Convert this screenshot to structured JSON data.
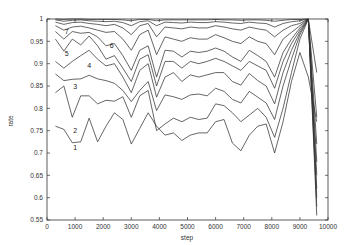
{
  "chart_data": {
    "type": "line",
    "title": "",
    "xlabel": "step",
    "ylabel": "rate",
    "xlim": [
      0,
      10000
    ],
    "ylim": [
      0.55,
      1.0
    ],
    "grid": false,
    "legend": "none (inline curve labels)",
    "x_ticks": [
      "0",
      "1000",
      "2000",
      "3000",
      "4000",
      "5000",
      "6000",
      "7000",
      "8000",
      "9000",
      "10000"
    ],
    "y_ticks": [
      "0.55",
      "0.6",
      "0.65",
      "0.7",
      "0.75",
      "0.8",
      "0.85",
      "0.9",
      "0.95",
      "1"
    ],
    "x": [
      300,
      600,
      900,
      1200,
      1500,
      1800,
      2100,
      2400,
      2700,
      3000,
      3300,
      3600,
      3900,
      4200,
      4500,
      4800,
      5100,
      5400,
      5700,
      6000,
      6300,
      6600,
      6900,
      7200,
      7500,
      7800,
      8100,
      8400,
      8700,
      9000,
      9300,
      9600
    ],
    "series": [
      {
        "name": "1",
        "label": "1",
        "values": [
          0.76,
          0.753,
          0.723,
          0.725,
          0.778,
          0.725,
          0.76,
          0.79,
          0.775,
          0.72,
          0.755,
          0.79,
          0.76,
          0.74,
          0.745,
          0.728,
          0.74,
          0.745,
          0.745,
          0.77,
          0.775,
          0.722,
          0.705,
          0.74,
          0.76,
          0.765,
          0.7,
          0.77,
          0.86,
          0.925,
          0.87,
          0.77
        ]
      },
      {
        "name": "2",
        "label": "2",
        "values": [
          0.835,
          0.85,
          0.78,
          0.828,
          0.828,
          0.81,
          0.818,
          0.816,
          0.826,
          0.78,
          0.828,
          0.84,
          0.75,
          0.765,
          0.778,
          0.77,
          0.78,
          0.775,
          0.778,
          0.81,
          0.806,
          0.79,
          0.77,
          0.785,
          0.8,
          0.78,
          0.735,
          0.8,
          0.88,
          0.955,
          1.0,
          0.56
        ]
      },
      {
        "name": "3",
        "label": "3",
        "values": [
          0.877,
          0.862,
          0.865,
          0.866,
          0.874,
          0.866,
          0.862,
          0.856,
          0.84,
          0.815,
          0.84,
          0.86,
          0.795,
          0.83,
          0.826,
          0.82,
          0.83,
          0.832,
          0.828,
          0.845,
          0.838,
          0.82,
          0.812,
          0.838,
          0.825,
          0.812,
          0.775,
          0.85,
          0.91,
          0.965,
          1.0,
          0.58
        ]
      },
      {
        "name": "4",
        "label": "4",
        "values": [
          0.905,
          0.89,
          0.905,
          0.918,
          0.93,
          0.91,
          0.895,
          0.9,
          0.87,
          0.835,
          0.885,
          0.9,
          0.825,
          0.87,
          0.88,
          0.86,
          0.875,
          0.87,
          0.875,
          0.88,
          0.88,
          0.86,
          0.852,
          0.878,
          0.862,
          0.85,
          0.81,
          0.88,
          0.93,
          0.97,
          1.0,
          0.6
        ]
      },
      {
        "name": "5",
        "label": "5",
        "values": [
          0.955,
          0.928,
          0.955,
          0.942,
          0.962,
          0.94,
          0.91,
          0.918,
          0.89,
          0.86,
          0.91,
          0.92,
          0.85,
          0.905,
          0.905,
          0.89,
          0.905,
          0.9,
          0.905,
          0.912,
          0.905,
          0.895,
          0.885,
          0.905,
          0.895,
          0.885,
          0.845,
          0.905,
          0.945,
          0.975,
          1.0,
          0.62
        ]
      },
      {
        "name": "6",
        "label": "6",
        "values": [
          0.972,
          0.955,
          0.972,
          0.968,
          0.97,
          0.96,
          0.94,
          0.945,
          0.918,
          0.885,
          0.93,
          0.94,
          0.87,
          0.93,
          0.928,
          0.915,
          0.928,
          0.925,
          0.928,
          0.935,
          0.928,
          0.915,
          0.905,
          0.93,
          0.918,
          0.905,
          0.87,
          0.925,
          0.955,
          0.98,
          1.0,
          0.65
        ]
      },
      {
        "name": "7",
        "label": "7",
        "values": [
          0.985,
          0.975,
          0.982,
          0.984,
          0.98,
          0.975,
          0.97,
          0.972,
          0.955,
          0.93,
          0.965,
          0.975,
          0.92,
          0.96,
          0.955,
          0.95,
          0.958,
          0.955,
          0.955,
          0.965,
          0.958,
          0.95,
          0.945,
          0.96,
          0.95,
          0.945,
          0.92,
          0.955,
          0.97,
          0.985,
          1.0,
          0.68
        ]
      },
      {
        "name": "8",
        "label": "",
        "values": [
          0.993,
          0.988,
          0.992,
          0.993,
          0.99,
          0.988,
          0.985,
          0.988,
          0.98,
          0.965,
          0.985,
          0.99,
          0.96,
          0.982,
          0.98,
          0.978,
          0.982,
          0.98,
          0.98,
          0.985,
          0.982,
          0.978,
          0.975,
          0.982,
          0.978,
          0.975,
          0.96,
          0.975,
          0.985,
          0.99,
          1.0,
          0.72
        ]
      },
      {
        "name": "9",
        "label": "",
        "values": [
          0.998,
          0.995,
          0.997,
          0.998,
          0.996,
          0.995,
          0.994,
          0.995,
          0.992,
          0.985,
          0.994,
          0.996,
          0.985,
          0.993,
          0.992,
          0.991,
          0.993,
          0.992,
          0.992,
          0.994,
          0.993,
          0.991,
          0.99,
          0.993,
          0.991,
          0.99,
          0.982,
          0.99,
          0.994,
          0.996,
          1.0,
          0.78
        ]
      },
      {
        "name": "10",
        "label": "",
        "values": [
          1.0,
          0.999,
          1.0,
          1.0,
          0.999,
          0.999,
          0.999,
          0.999,
          0.998,
          0.996,
          0.999,
          0.999,
          0.996,
          0.998,
          0.998,
          0.998,
          0.998,
          0.998,
          0.998,
          0.999,
          0.998,
          0.998,
          0.997,
          0.998,
          0.998,
          0.997,
          0.995,
          0.997,
          0.999,
          0.999,
          1.0,
          0.88
        ]
      }
    ],
    "curve_labels": [
      {
        "text": "1",
        "x": 1000,
        "y": 0.707
      },
      {
        "text": "2",
        "x": 1000,
        "y": 0.745
      },
      {
        "text": "3",
        "x": 1000,
        "y": 0.843
      },
      {
        "text": "4",
        "x": 1500,
        "y": 0.89
      },
      {
        "text": "5",
        "x": 700,
        "y": 0.918
      },
      {
        "text": "6",
        "x": 2300,
        "y": 0.935
      },
      {
        "text": "7",
        "x": 700,
        "y": 0.967
      }
    ]
  }
}
